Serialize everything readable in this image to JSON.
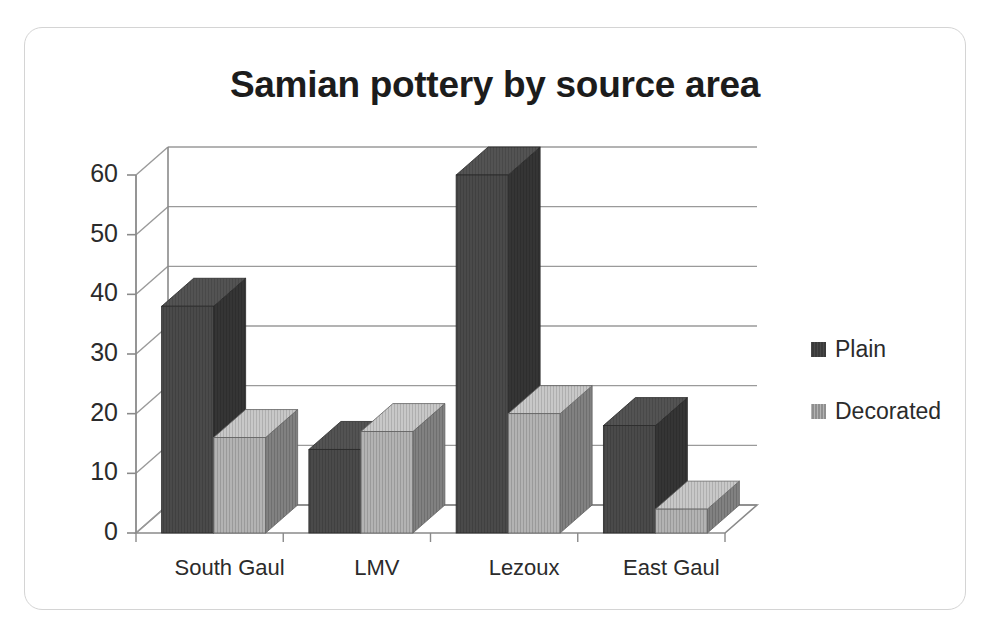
{
  "chart_data": {
    "type": "bar",
    "title": "Samian pottery by source area",
    "xlabel": "",
    "ylabel": "",
    "categories": [
      "South Gaul",
      "LMV",
      "Lezoux",
      "East Gaul"
    ],
    "series": [
      {
        "name": "Plain",
        "color": "#4a4a4a",
        "values": [
          38,
          14,
          60,
          18
        ]
      },
      {
        "name": "Decorated",
        "color": "#b3b3b3",
        "values": [
          16,
          17,
          20,
          4
        ]
      }
    ],
    "ylim": [
      0,
      60
    ],
    "yticks": [
      0,
      10,
      20,
      30,
      40,
      50,
      60
    ],
    "ytick_labels": [
      "0",
      "10",
      "20",
      "30",
      "40",
      "50",
      "60"
    ],
    "grid": true,
    "grid_axis": "y",
    "legend_position": "right",
    "style": "3d-clustered-column"
  },
  "legend": {
    "entries": [
      {
        "label": "Plain"
      },
      {
        "label": "Decorated"
      }
    ]
  },
  "colors": {
    "plain": "#4a4a4a",
    "decorated": "#b3b3b3",
    "grid": "#9a9a9a",
    "axis": "#8a8a8a",
    "border": "#d4d4d4",
    "text": "#2b2b2b",
    "title": "#1c1c1c"
  }
}
